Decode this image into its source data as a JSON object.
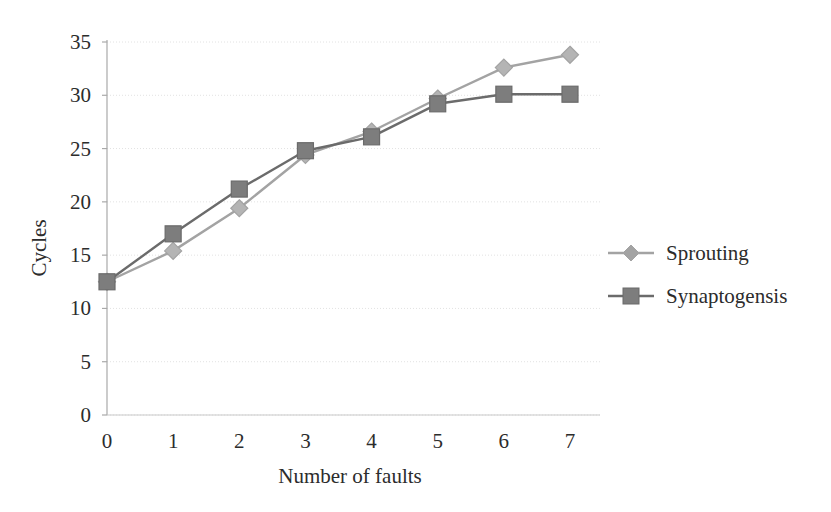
{
  "chart_data": {
    "type": "line",
    "title": "",
    "xlabel": "Number of faults",
    "ylabel": "Cycles",
    "x": [
      0,
      1,
      2,
      3,
      4,
      5,
      6,
      7
    ],
    "xtick_labels": [
      "0",
      "1",
      "2",
      "3",
      "4",
      "5",
      "6",
      "7"
    ],
    "ytick_labels": [
      "0",
      "5",
      "10",
      "15",
      "20",
      "25",
      "30",
      "35"
    ],
    "yticks": [
      0,
      5,
      10,
      15,
      20,
      25,
      30,
      35
    ],
    "xlim": [
      0,
      7
    ],
    "ylim": [
      0,
      35
    ],
    "grid": true,
    "grid_axis": "y",
    "legend_position": "right",
    "series": [
      {
        "name": "Sprouting",
        "values": [
          12.5,
          15.4,
          19.4,
          24.4,
          26.6,
          29.7,
          32.6,
          33.8
        ],
        "color": "#a3a3a3",
        "marker": "diamond"
      },
      {
        "name": "Synaptogensis",
        "values": [
          12.5,
          17.0,
          21.2,
          24.8,
          26.1,
          29.2,
          30.1,
          30.1
        ],
        "color": "#6b6b6b",
        "marker": "square"
      }
    ]
  },
  "legend": {
    "items": [
      {
        "label": "Sprouting"
      },
      {
        "label": "Synaptogensis"
      }
    ]
  },
  "axes": {
    "y_title": "Cycles",
    "x_title": "Number of faults"
  },
  "colors": {
    "background": "#ffffff",
    "axis": "#9a9a9a",
    "grid": "#e2e2e2",
    "text": "#2c2c2c",
    "series_light": "#a3a3a3",
    "series_dark": "#6b6b6b"
  }
}
